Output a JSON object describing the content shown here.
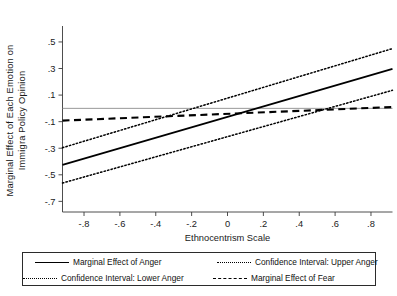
{
  "chart_data": {
    "type": "line",
    "title": "",
    "xlabel": "Ethnocentrism Scale",
    "ylabel_line1": "Marginal Effect of Each Emotion on",
    "ylabel_line2": "Immigra Policy Opinion",
    "xlim": [
      -0.92,
      0.92
    ],
    "ylim": [
      -0.78,
      0.62
    ],
    "xticks": [
      -0.8,
      -0.6,
      -0.4,
      -0.2,
      0,
      0.2,
      0.4,
      0.6,
      0.8
    ],
    "xticklabels": [
      "-.8",
      "-.6",
      "-.4",
      "-.2",
      "0",
      ".2",
      ".4",
      ".6",
      ".8"
    ],
    "yticks": [
      0.5,
      0.3,
      0.1,
      -0.1,
      -0.3,
      -0.5,
      -0.7
    ],
    "yticklabels": [
      ".5",
      ".3",
      ".1",
      "-.1",
      "-.3",
      "-.5",
      "-.7"
    ],
    "grid": false,
    "zero_reference_line": 0,
    "legend_position": "below-plot",
    "series": [
      {
        "name": "Marginal Effect of Anger",
        "style": "solid",
        "color": "#000000",
        "x": [
          -0.92,
          0.92
        ],
        "y": [
          -0.425,
          0.297
        ]
      },
      {
        "name": "Confidence Interval: Upper Anger",
        "style": "dotted",
        "color": "#000000",
        "x": [
          -0.92,
          0.92
        ],
        "y": [
          -0.296,
          0.45
        ]
      },
      {
        "name": "Confidence Interval: Lower Anger",
        "style": "dotted",
        "color": "#000000",
        "x": [
          -0.92,
          0.92
        ],
        "y": [
          -0.562,
          0.136
        ]
      },
      {
        "name": "Marginal Effect of Fear",
        "style": "dashed",
        "color": "#000000",
        "x": [
          -0.92,
          0.92
        ],
        "y": [
          -0.092,
          0.01
        ]
      }
    ]
  },
  "legend": {
    "items": [
      {
        "label": "Marginal Effect of Anger",
        "style": "solid"
      },
      {
        "label": "Confidence Interval: Upper Anger",
        "style": "dotted"
      },
      {
        "label": "Confidence Interval: Lower Anger",
        "style": "dotted"
      },
      {
        "label": "Marginal Effect of Fear",
        "style": "dashed"
      }
    ]
  },
  "axis": {
    "x_title": "Ethnocentrism Scale",
    "y_title_line1": "Marginal Effect of Each Emotion on",
    "y_title_line2": "Immigra Policy Opinion",
    "x_tick_labels": [
      "-.8",
      "-.6",
      "-.4",
      "-.2",
      "0",
      ".2",
      ".4",
      ".6",
      ".8"
    ],
    "y_tick_labels": [
      ".5",
      ".3",
      ".1",
      "-.1",
      "-.3",
      "-.5",
      "-.7"
    ]
  }
}
